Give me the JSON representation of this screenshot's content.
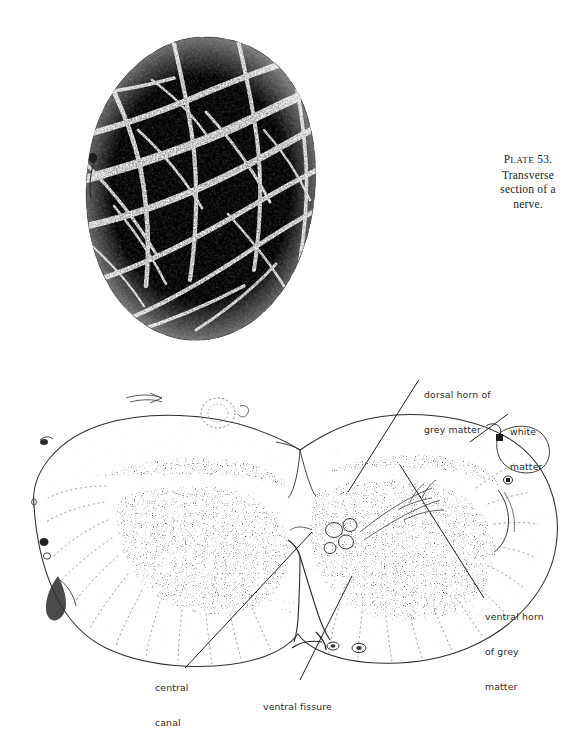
{
  "page": {
    "background_color": "#ffffff",
    "ink_color": "#1b1b1b",
    "label_color": "#2a2a2a"
  },
  "caption": {
    "plate_prefix_cap": "P",
    "plate_prefix_rest": "LATE",
    "plate_number": "53.",
    "line2": "Transverse",
    "line3": "section of a",
    "line4": "nerve."
  },
  "figures": {
    "nerve": {
      "name": "transverse-section-of-nerve-micrograph",
      "description": "halftone micrograph of an oval peripheral nerve cross section showing dark stippled fascicles separated by pale perineurial septa"
    },
    "cord": {
      "name": "transverse-section-of-spinal-cord-drawing",
      "description": "fine line drawing of a transverse section of the spinal cord with stippled grey matter, radial white matter striations, central canal, ventral fissure and attached rootlets"
    }
  },
  "labels": [
    {
      "id": "dorsal-horn",
      "lines": [
        "dorsal horn of",
        "grey matter"
      ]
    },
    {
      "id": "white-matter",
      "lines": [
        "white",
        "matter"
      ]
    },
    {
      "id": "ventral-horn",
      "lines": [
        "ventral horn",
        "of grey",
        "matter"
      ]
    },
    {
      "id": "central-canal",
      "lines": [
        "central",
        "canal"
      ]
    },
    {
      "id": "ventral-fissure",
      "lines": [
        "ventral fissure"
      ]
    }
  ]
}
